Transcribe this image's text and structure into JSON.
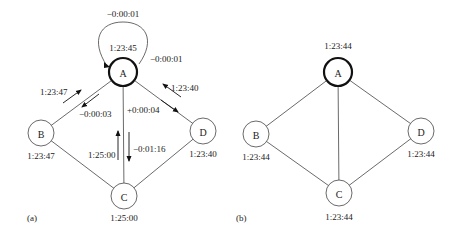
{
  "panels": [
    {
      "id": "a",
      "caption": "(a)",
      "nodes": [
        {
          "id": "A",
          "label": "A",
          "time": "1:23:45",
          "master": true
        },
        {
          "id": "B",
          "label": "B",
          "time": "1:23:47"
        },
        {
          "id": "C",
          "label": "C",
          "time": "1:25:00"
        },
        {
          "id": "D",
          "label": "D",
          "time": "1:23:40"
        }
      ],
      "edges": [
        [
          "A",
          "B"
        ],
        [
          "A",
          "C"
        ],
        [
          "A",
          "D"
        ],
        [
          "B",
          "C"
        ],
        [
          "D",
          "C"
        ]
      ],
      "self_loop": {
        "node": "A",
        "label_top": "−0:00:01",
        "label_right": "−0:00:01"
      },
      "messages": {
        "b_to_a": "1:23:47",
        "a_to_b": "−0:00:03",
        "d_to_a": "1:23:40",
        "a_to_d": "+0:00:04",
        "c_to_a": "1:25:00",
        "a_to_c": "−0:01:16"
      }
    },
    {
      "id": "b",
      "caption": "(b)",
      "nodes": [
        {
          "id": "A",
          "label": "A",
          "time": "1:23:44",
          "master": true
        },
        {
          "id": "B",
          "label": "B",
          "time": "1:23:44"
        },
        {
          "id": "C",
          "label": "C",
          "time": "1:23:44"
        },
        {
          "id": "D",
          "label": "D",
          "time": "1:23:44"
        }
      ],
      "edges": [
        [
          "A",
          "B"
        ],
        [
          "A",
          "C"
        ],
        [
          "A",
          "D"
        ],
        [
          "B",
          "C"
        ],
        [
          "D",
          "C"
        ]
      ]
    }
  ]
}
